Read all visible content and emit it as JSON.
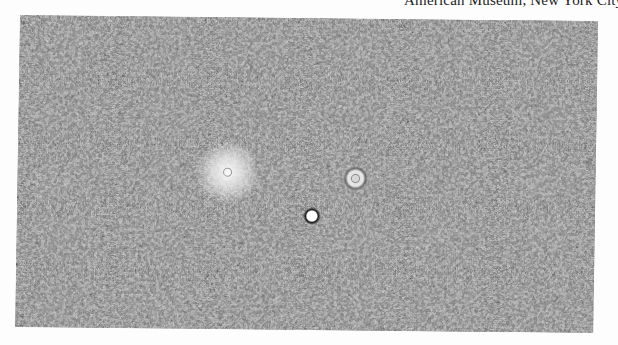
{
  "caption": {
    "text": "American Museum, New York City"
  },
  "figure": {
    "type": "micrograph",
    "tone": "grayscale",
    "bright_spots": [
      {
        "name": "diffuse-halo-left",
        "x": 210,
        "y": 155,
        "r": 30
      },
      {
        "name": "ring-cell-right",
        "x": 338,
        "y": 160,
        "r": 13
      },
      {
        "name": "bright-cell-center",
        "x": 295,
        "y": 198,
        "r": 9
      }
    ],
    "colors": {
      "dark": "#1a1a1a",
      "mid": "#8a8a8a",
      "light": "#e8e8e8",
      "paper": "#fdfdfd"
    }
  }
}
